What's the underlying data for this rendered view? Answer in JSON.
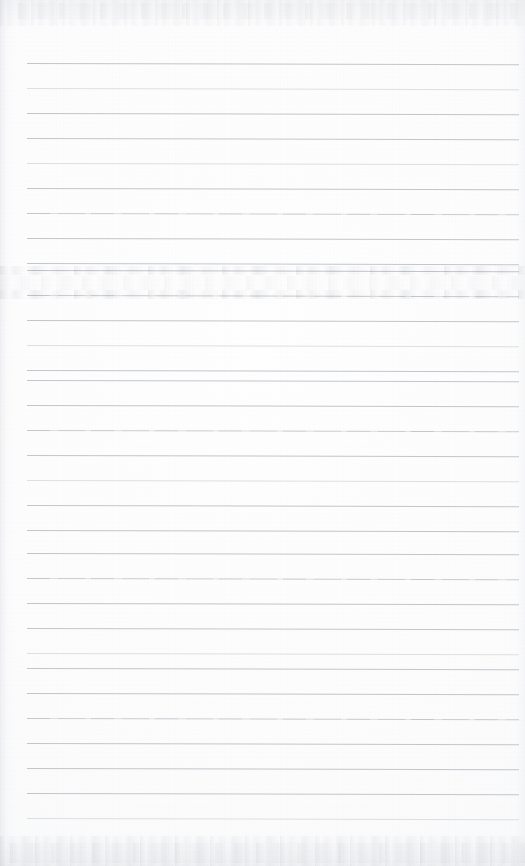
{
  "document": {
    "type": "scanned-lined-notebook-page",
    "description": "Blank ruled notebook page scan with no handwriting or printed text",
    "page_width": 525,
    "page_height": 866,
    "text_content": "",
    "has_handwriting": false,
    "has_printed_text": false
  },
  "paper": {
    "background_color": "#fbfbfc",
    "edge_color": "#f3f4f6",
    "texture": "mottled scanner grain"
  },
  "ruling": {
    "line_color": "#bdc1c7",
    "line_thickness_px": 1,
    "line_spacing_px": 25,
    "first_line_y": 63,
    "last_line_y": 818,
    "line_start_x": 27,
    "line_end_x": 519,
    "line_count": 31,
    "skew_degrees": 0.14,
    "lines": [
      {
        "y": 63,
        "style": "normal"
      },
      {
        "y": 88,
        "style": "faint"
      },
      {
        "y": 113,
        "style": "normal"
      },
      {
        "y": 138,
        "style": "normal"
      },
      {
        "y": 163,
        "style": "faint"
      },
      {
        "y": 188,
        "style": "normal"
      },
      {
        "y": 213,
        "style": "patchy"
      },
      {
        "y": 238,
        "style": "normal"
      },
      {
        "y": 263,
        "style": "normal"
      },
      {
        "y": 270,
        "style": "normal"
      },
      {
        "y": 295,
        "style": "patchy"
      },
      {
        "y": 320,
        "style": "normal"
      },
      {
        "y": 345,
        "style": "faint"
      },
      {
        "y": 370,
        "style": "normal"
      },
      {
        "y": 380,
        "style": "normal"
      },
      {
        "y": 405,
        "style": "normal"
      },
      {
        "y": 430,
        "style": "patchy"
      },
      {
        "y": 455,
        "style": "normal"
      },
      {
        "y": 480,
        "style": "faint"
      },
      {
        "y": 505,
        "style": "normal"
      },
      {
        "y": 530,
        "style": "normal"
      },
      {
        "y": 553,
        "style": "normal"
      },
      {
        "y": 578,
        "style": "patchy"
      },
      {
        "y": 603,
        "style": "normal"
      },
      {
        "y": 628,
        "style": "normal"
      },
      {
        "y": 653,
        "style": "faint"
      },
      {
        "y": 668,
        "style": "normal"
      },
      {
        "y": 693,
        "style": "normal"
      },
      {
        "y": 718,
        "style": "patchy"
      },
      {
        "y": 743,
        "style": "normal"
      },
      {
        "y": 768,
        "style": "normal"
      },
      {
        "y": 793,
        "style": "normal"
      },
      {
        "y": 818,
        "style": "faint"
      }
    ]
  },
  "artifacts": {
    "smudges": [
      {
        "name": "ghost-band-upper",
        "x": 0,
        "y": 266,
        "width": 525,
        "height": 9,
        "style": "band"
      },
      {
        "name": "ghost-band-lower",
        "x": 0,
        "y": 290,
        "width": 525,
        "height": 9,
        "style": "band"
      },
      {
        "name": "ghost-wash-mid",
        "x": 0,
        "y": 276,
        "width": 525,
        "height": 14,
        "style": "soft"
      },
      {
        "name": "ghost-wash-top",
        "x": 18,
        "y": 3,
        "width": 500,
        "height": 16,
        "style": "soft"
      },
      {
        "name": "ghost-wash-bottom",
        "x": 10,
        "y": 843,
        "width": 515,
        "height": 20,
        "style": "soft"
      }
    ]
  }
}
